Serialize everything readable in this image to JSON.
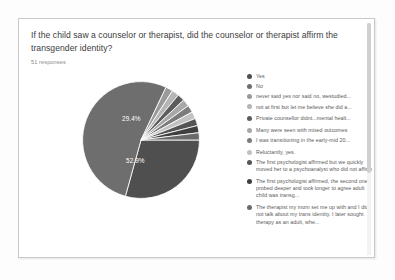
{
  "card": {
    "question": "If the child saw a counselor or therapist, did the counselor or therapist affirm the transgender identity?",
    "responses": "51 responses"
  },
  "chart_data": {
    "type": "pie",
    "title": "If the child saw a counselor or therapist, did the counselor or therapist affirm the transgender identity?",
    "subtitle": "51 responses",
    "total_responses": 51,
    "legend_position": "right",
    "grid": false,
    "visible_labels": [
      "52.9%",
      "29.4%"
    ],
    "categories": [
      "Yes",
      "No",
      "never said yes nor said no, westudied...",
      "not at first but let me believe she did a...",
      "Private counsellor didnt...mental healt...",
      "Many were seen with mixed outcomes",
      "I was transitioning in the early-mid 20...",
      "Reluctantly, yes.",
      "The first psychologist affirmed but we quickly moved her to a psychoanalyst who did not affirm",
      "The first psychologist affirmed, the second one probed deeper and took longer to agree adult child was transg...",
      "The therapist my mom set me up with and I did not talk about my trans identity. I later sought therapy as an adult, whe..."
    ],
    "values": [
      29.4,
      52.9,
      2.0,
      2.0,
      2.0,
      2.0,
      2.0,
      2.0,
      2.0,
      2.0,
      2.0
    ],
    "colors": [
      "#4f4f4f",
      "#6e6e6e",
      "#9a9a9a",
      "#b5b5b5",
      "#5c5c5c",
      "#a8a8a8",
      "#7c7c7c",
      "#c2c2c2",
      "#555555",
      "#3f3f3f",
      "#6a6a6a"
    ]
  }
}
